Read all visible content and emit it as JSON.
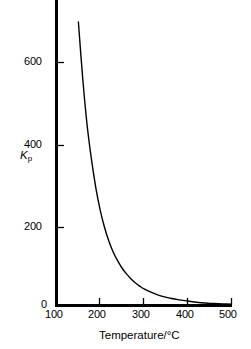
{
  "chart_data": {
    "type": "line",
    "title": "",
    "xlabel": "Temperature/°C",
    "ylabel": "Kp",
    "ylabel_base": "K",
    "ylabel_sub": "p",
    "xlim": [
      100,
      500
    ],
    "ylim": [
      0,
      700
    ],
    "grid": false,
    "legend": null,
    "xticks": [
      100,
      200,
      300,
      400,
      500
    ],
    "xtick_labels": [
      "100",
      "200",
      "300",
      "400",
      "500"
    ],
    "yticks": [
      0,
      200,
      400,
      600
    ],
    "ytick_labels": [
      "0",
      "200",
      "400",
      "600"
    ],
    "series": [
      {
        "name": "Kp",
        "color": "#000000",
        "x": [
          150,
          160,
          170,
          180,
          190,
          200,
          210,
          220,
          230,
          240,
          250,
          260,
          270,
          280,
          290,
          300,
          320,
          340,
          360,
          380,
          400,
          420,
          440,
          460,
          480,
          500
        ],
        "y": [
          700,
          560,
          445,
          360,
          290,
          235,
          192,
          158,
          131,
          110,
          92,
          78,
          66,
          56,
          48,
          41,
          31,
          23,
          18,
          14,
          11,
          8,
          6,
          5,
          4,
          3
        ]
      }
    ],
    "axis_color": "#000000",
    "curve_color": "#000000",
    "background": "#ffffff"
  },
  "axes": {
    "x_title": "Temperature/°C",
    "y_title_base": "K",
    "y_title_sub": "p"
  },
  "ticks": {
    "x": [
      "100",
      "200",
      "300",
      "400",
      "500"
    ],
    "y": [
      "0",
      "200",
      "400",
      "600"
    ]
  }
}
